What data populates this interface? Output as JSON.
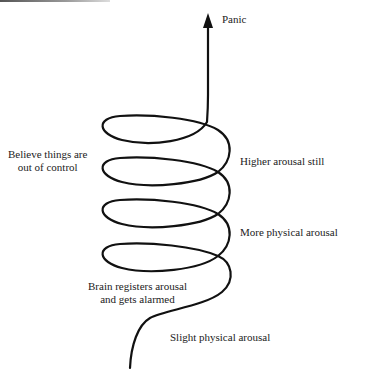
{
  "diagram": {
    "type": "spiral-escalation",
    "top_label": "Panic",
    "left_labels": [
      {
        "id": "believe",
        "lines": [
          "Believe things are",
          "out of control"
        ]
      },
      {
        "id": "brain",
        "lines": [
          "Brain registers arousal",
          "and gets alarmed"
        ]
      }
    ],
    "right_labels": [
      {
        "id": "higher",
        "text": "Higher arousal still"
      },
      {
        "id": "more",
        "text": "More physical arousal"
      },
      {
        "id": "slight",
        "text": "Slight physical arousal"
      }
    ],
    "colors": {
      "stroke": "#111111",
      "text": "#222222",
      "background": "#ffffff"
    }
  }
}
